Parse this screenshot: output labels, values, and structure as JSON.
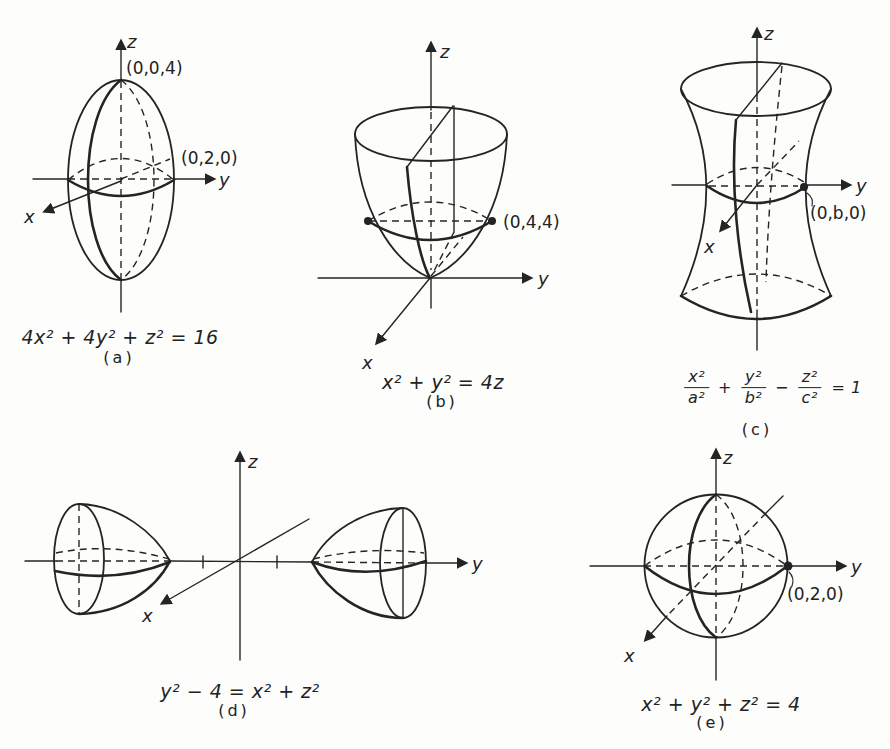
{
  "colors": {
    "ink": "#222222",
    "paper": "#fdfdfb"
  },
  "axis_labels": {
    "x": "x",
    "y": "y",
    "z": "z"
  },
  "figures": [
    {
      "id": "a",
      "caption": "(a)",
      "equation": "4x² + 4y² + z² = 16",
      "point_labels": {
        "top": "(0,0,4)",
        "y_intercept": "(0,2,0)"
      }
    },
    {
      "id": "b",
      "caption": "(b)",
      "equation": "x² + y² = 4z",
      "point_labels": {
        "y_intercept": "(0,4,4)"
      }
    },
    {
      "id": "c",
      "caption": "(c)",
      "equation_parts": {
        "f1_num": "x²",
        "f1_den": "a²",
        "op1": "+",
        "f2_num": "y²",
        "f2_den": "b²",
        "op2": "−",
        "f3_num": "z²",
        "f3_den": "c²",
        "rhs": "= 1"
      },
      "point_labels": {
        "y_intercept": "(0,b,0)"
      }
    },
    {
      "id": "d",
      "caption": "(d)",
      "equation": "y² − 4 = x² + z²"
    },
    {
      "id": "e",
      "caption": "(e)",
      "equation": "x² + y² + z² = 4",
      "point_labels": {
        "y_intercept": "(0,2,0)"
      }
    }
  ]
}
